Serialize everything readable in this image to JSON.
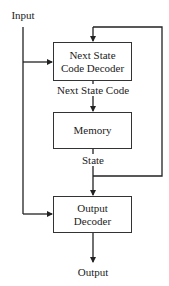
{
  "diagram": {
    "input_label": "Input",
    "output_label": "Output",
    "blocks": [
      {
        "id": "next-state-decoder",
        "line1": "Next State",
        "line2": "Code Decoder"
      },
      {
        "id": "memory",
        "line1": "Memory"
      },
      {
        "id": "output-decoder",
        "line1": "Output",
        "line2": "Decoder"
      }
    ],
    "signals": {
      "next_state_code": "Next State Code",
      "state": "State"
    },
    "colors": {
      "line": "#222222",
      "box_border": "#333333",
      "background": "#ffffff"
    }
  }
}
